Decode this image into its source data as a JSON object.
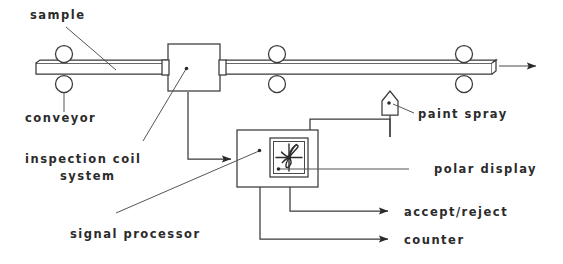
{
  "diagram": {
    "background_color": "#ffffff",
    "line_color": "#3a3a3a",
    "text_color": "#2b2b2b",
    "labels": {
      "sample": "sample",
      "conveyor": "conveyor",
      "inspection_coil_line1": "inspection coil",
      "inspection_coil_line2": "system",
      "signal_processor": "signal processor",
      "paint_spray": "paint spray",
      "polar_display": "polar display",
      "accept_reject": "accept/reject",
      "counter": "counter"
    },
    "components": [
      {
        "name": "sample-bar",
        "type": "workpiece",
        "description": "long horizontal bar travelling left to right"
      },
      {
        "name": "conveyor-rollers",
        "type": "rollers",
        "count": 6,
        "description": "three pairs of pinch rollers above and below the bar"
      },
      {
        "name": "inspection-coil-box",
        "type": "encircling coil",
        "description": "square block surrounding the bar with collars each side"
      },
      {
        "name": "signal-processor-box",
        "type": "electronics enclosure",
        "description": "rectangular box receiving the coil signal"
      },
      {
        "name": "polar-display",
        "type": "crt display",
        "description": "inset square showing cross axes with lobed impedance trace"
      },
      {
        "name": "paint-spray-nozzle",
        "type": "marker",
        "description": "pentagon house-shaped nozzle above the bar"
      }
    ],
    "signal_flow": [
      {
        "from": "inspection-coil-box",
        "to": "signal-processor-box",
        "arrow": true
      },
      {
        "from": "signal-processor-box",
        "to": "paint-spray-nozzle",
        "arrow": false
      },
      {
        "from": "signal-processor-box",
        "to": "accept/reject",
        "arrow": true
      },
      {
        "from": "signal-processor-box",
        "to": "counter",
        "arrow": true
      }
    ],
    "travel_direction": "left-to-right"
  }
}
